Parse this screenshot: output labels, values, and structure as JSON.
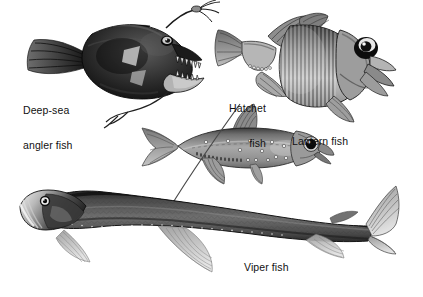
{
  "figure": {
    "background_color": "#ffffff",
    "width": 423,
    "height": 297,
    "style": "grayscale scientific illustration",
    "text_color": "#111111"
  },
  "labels": {
    "angler": {
      "line1": "Deep-sea",
      "line2": "angler fish"
    },
    "hatchet": {
      "line1": "Hatchet",
      "line2": "fish"
    },
    "lantern": {
      "line1": "Lantern fish"
    },
    "viper": {
      "line1": "Viper fish"
    }
  },
  "specimens": [
    {
      "id": "deep-sea-angler-fish",
      "name": "Deep-sea angler fish",
      "position": "top-left",
      "facing": "right",
      "tone": "very dark / near black",
      "features": [
        "bulbous body",
        "illicium with esca lure",
        "long fang teeth",
        "fan caudal fin",
        "trailing barbels"
      ]
    },
    {
      "id": "hatchet-fish",
      "name": "Hatchet fish",
      "position": "top-right",
      "facing": "right",
      "tone": "mid gray with silver highlights",
      "features": [
        "deep compressed body",
        "vertical ribbed flank",
        "large upward eye",
        "row of ventral photophores",
        "forked tail"
      ]
    },
    {
      "id": "lantern-fish",
      "name": "Lantern fish",
      "position": "middle",
      "facing": "right",
      "tone": "light to mid gray",
      "features": [
        "large black eye",
        "rows of photophores",
        "adipose fin",
        "deeply forked caudal fin"
      ]
    },
    {
      "id": "viper-fish",
      "name": "Viper fish",
      "position": "bottom",
      "facing": "left",
      "tone": "dark gray scaled body",
      "features": [
        "elongated body",
        "hexagonal scale pattern",
        "pale silvery head",
        "large eye",
        "elongated dorsal ray",
        "large pectoral and pelvic fins"
      ]
    }
  ]
}
